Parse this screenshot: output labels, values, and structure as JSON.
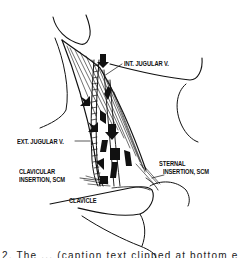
{
  "figure": {
    "type": "anatomical line illustration",
    "labels": {
      "int_jugular": "INT. JUGULAR V.",
      "ext_jugular": "EXT. JUGULAR V.",
      "clavicular_line1": "CLAVICULAR",
      "clavicular_line2": "INSERTION, SCM",
      "sternal_line1": "STERNAL",
      "sternal_line2": "INSERTION, SCM",
      "clavicle": "CLAVICLE"
    },
    "caption": "2. The ... (caption text clipped at bottom edge)",
    "colors": {
      "ink": "#111111",
      "background": "#ffffff"
    }
  }
}
